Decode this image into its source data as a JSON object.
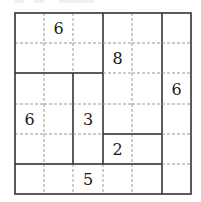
{
  "puzzle": {
    "rows": 6,
    "cols": 6,
    "grid_origin": [
      15,
      13
    ],
    "col_lines": [
      15,
      44,
      73,
      103,
      132,
      162,
      191
    ],
    "row_lines": [
      13,
      43,
      73,
      104,
      134,
      164,
      194
    ],
    "colors": {
      "solid": "#333333",
      "dashed": "#999999",
      "text": "#1a1a1a"
    },
    "givens": [
      {
        "row": 0,
        "col": 1,
        "value": "6"
      },
      {
        "row": 1,
        "col": 3,
        "value": "8"
      },
      {
        "row": 2,
        "col": 5,
        "value": "6"
      },
      {
        "row": 3,
        "col": 0,
        "value": "6"
      },
      {
        "row": 3,
        "col": 2,
        "value": "3"
      },
      {
        "row": 4,
        "col": 3,
        "value": "2"
      },
      {
        "row": 5,
        "col": 2,
        "value": "5"
      }
    ],
    "regions": [
      [
        0,
        0,
        0,
        1,
        1,
        2
      ],
      [
        0,
        0,
        0,
        1,
        1,
        2
      ],
      [
        3,
        3,
        4,
        1,
        1,
        2
      ],
      [
        3,
        3,
        4,
        1,
        1,
        2
      ],
      [
        3,
        3,
        4,
        5,
        5,
        2
      ],
      [
        6,
        6,
        6,
        6,
        6,
        2
      ]
    ]
  }
}
